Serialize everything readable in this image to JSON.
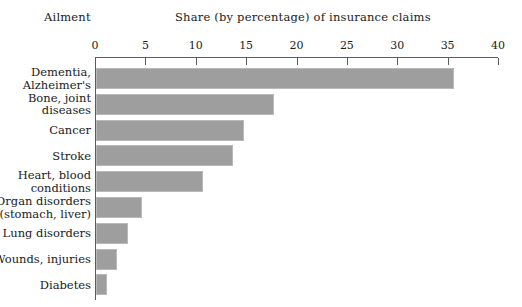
{
  "header": {
    "category_axis_label": "Ailment",
    "title": "Share (by percentage) of insurance claims"
  },
  "chart_data": {
    "type": "bar",
    "orientation": "horizontal",
    "title": "Share (by percentage) of insurance claims",
    "xlabel": "Share (by percentage) of insurance claims",
    "ylabel": "Ailment",
    "xlim": [
      0,
      40
    ],
    "grid": false,
    "legend": null,
    "bar_color": "#9e9e9e",
    "bar_border_color": "#b9b9b9",
    "axis_color": "#5b5b5b",
    "tick_values": [
      0,
      5,
      10,
      15,
      20,
      25,
      30,
      35,
      40
    ],
    "tick_labels": [
      "0",
      "5",
      "10",
      "15",
      "20",
      "25",
      "30",
      "35",
      "40"
    ],
    "categories": [
      "Dementia,\nAlzheimer's",
      "Bone, joint\ndiseases",
      "Cancer",
      "Stroke",
      "Heart, blood\nconditions",
      "Organ disorders\n(stomach, liver)",
      "Lung disorders",
      "Wounds, injuries",
      "Diabetes"
    ],
    "values": [
      35.5,
      17.7,
      14.7,
      13.6,
      10.6,
      4.6,
      3.2,
      2.1,
      1.1
    ]
  }
}
